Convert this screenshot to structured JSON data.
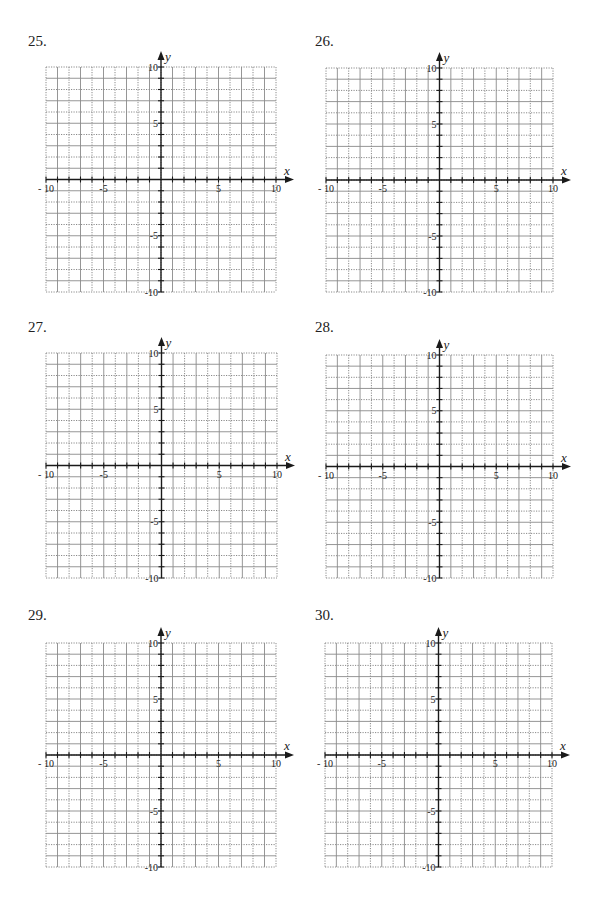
{
  "page": {
    "background": "#ffffff"
  },
  "style": {
    "grid_color": "#8a8a8a",
    "axis_color": "#1a1a1a",
    "text_color": "#222222"
  },
  "axes": {
    "x_label": "x",
    "y_label": "y",
    "x_min": -10,
    "x_max": 10,
    "y_min": -10,
    "y_max": 10,
    "tick_step": 1,
    "x_tick_labels": [
      {
        "value": -10,
        "text": "- 10"
      },
      {
        "value": -5,
        "text": "-5"
      },
      {
        "value": 5,
        "text": "5"
      },
      {
        "value": 10,
        "text": "10"
      }
    ],
    "y_tick_labels": [
      {
        "value": 10,
        "text": "10"
      },
      {
        "value": 5,
        "text": "5"
      },
      {
        "value": -5,
        "text": "-5"
      },
      {
        "value": -10,
        "text": "-10"
      }
    ]
  },
  "problems": [
    {
      "number": "25.",
      "label_pos": [
        28,
        34
      ],
      "grid": {
        "left": 46,
        "top": 67,
        "right": 276,
        "bottom": 292
      }
    },
    {
      "number": "26.",
      "label_pos": [
        315,
        34
      ],
      "grid": {
        "left": 326,
        "top": 68,
        "right": 553,
        "bottom": 292
      }
    },
    {
      "number": "27.",
      "label_pos": [
        28,
        320
      ],
      "grid": {
        "left": 46,
        "top": 353,
        "right": 277,
        "bottom": 578
      }
    },
    {
      "number": "28.",
      "label_pos": [
        315,
        320
      ],
      "grid": {
        "left": 326,
        "top": 355,
        "right": 553,
        "bottom": 578
      }
    },
    {
      "number": "29.",
      "label_pos": [
        28,
        608
      ],
      "grid": {
        "left": 46,
        "top": 643,
        "right": 276,
        "bottom": 867
      }
    },
    {
      "number": "30.",
      "label_pos": [
        315,
        608
      ],
      "grid": {
        "left": 325,
        "top": 643,
        "right": 552,
        "bottom": 867
      }
    }
  ],
  "chart_data": [
    {
      "type": "scatter",
      "title": "25.",
      "xlabel": "x",
      "ylabel": "y",
      "xlim": [
        -10,
        10
      ],
      "ylim": [
        -10,
        10
      ],
      "grid": true,
      "x_ticks": [
        -10,
        -5,
        5,
        10
      ],
      "y_ticks": [
        10,
        5,
        -5,
        -10
      ],
      "series": []
    },
    {
      "type": "scatter",
      "title": "26.",
      "xlabel": "x",
      "ylabel": "y",
      "xlim": [
        -10,
        10
      ],
      "ylim": [
        -10,
        10
      ],
      "grid": true,
      "x_ticks": [
        -10,
        -5,
        5,
        10
      ],
      "y_ticks": [
        10,
        5,
        -5,
        -10
      ],
      "series": []
    },
    {
      "type": "scatter",
      "title": "27.",
      "xlabel": "x",
      "ylabel": "y",
      "xlim": [
        -10,
        10
      ],
      "ylim": [
        -10,
        10
      ],
      "grid": true,
      "x_ticks": [
        -10,
        -5,
        5,
        10
      ],
      "y_ticks": [
        10,
        5,
        -5,
        -10
      ],
      "series": []
    },
    {
      "type": "scatter",
      "title": "28.",
      "xlabel": "x",
      "ylabel": "y",
      "xlim": [
        -10,
        10
      ],
      "ylim": [
        -10,
        10
      ],
      "grid": true,
      "x_ticks": [
        -10,
        -5,
        5,
        10
      ],
      "y_ticks": [
        10,
        5,
        -5,
        -10
      ],
      "series": []
    },
    {
      "type": "scatter",
      "title": "29.",
      "xlabel": "x",
      "ylabel": "y",
      "xlim": [
        -10,
        10
      ],
      "ylim": [
        -10,
        10
      ],
      "grid": true,
      "x_ticks": [
        -10,
        -5,
        5,
        10
      ],
      "y_ticks": [
        10,
        5,
        -5,
        -10
      ],
      "series": []
    },
    {
      "type": "scatter",
      "title": "30.",
      "xlabel": "x",
      "ylabel": "y",
      "xlim": [
        -10,
        10
      ],
      "ylim": [
        -10,
        10
      ],
      "grid": true,
      "x_ticks": [
        -10,
        -5,
        5,
        10
      ],
      "y_ticks": [
        10,
        5,
        -5,
        -10
      ],
      "series": []
    }
  ]
}
